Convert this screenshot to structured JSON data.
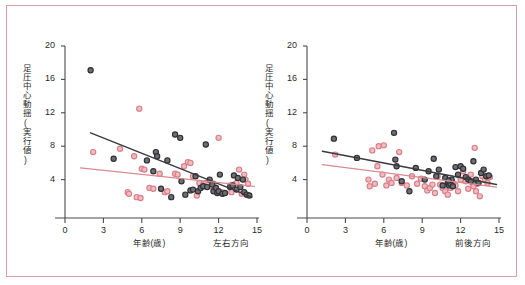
{
  "figure": {
    "frame_color": "#d8a0a6",
    "background": "#ffffff"
  },
  "colors": {
    "series_dark_fill": "#6d6d73",
    "series_dark_stroke": "#2f2f33",
    "series_pink_fill": "#f0bcc0",
    "series_pink_stroke": "#d97f88",
    "fit_dark": "#3b3b3f",
    "fit_pink": "#d98b92",
    "axis": "#4a4a4a"
  },
  "chart_data": [
    {
      "type": "scatter",
      "panel": "left",
      "title": "",
      "xlabel": "年齢(歳)",
      "ylabel": "足圧中心動揺(実行値)",
      "direction_label": "左右方向",
      "xlim": [
        0,
        15
      ],
      "ylim": [
        0,
        20
      ],
      "xticks": [
        0,
        3,
        6,
        9,
        12,
        15
      ],
      "yticks": [
        4,
        8,
        12,
        16,
        20
      ],
      "grid": false,
      "legend": "none",
      "series": [
        {
          "name": "dark",
          "marker": "open-circle-dark",
          "points": [
            [
              2.0,
              17.1
            ],
            [
              3.8,
              6.5
            ],
            [
              6.4,
              6.3
            ],
            [
              6.9,
              5.0
            ],
            [
              7.1,
              7.3
            ],
            [
              7.2,
              6.8
            ],
            [
              7.5,
              2.9
            ],
            [
              8.0,
              6.3
            ],
            [
              8.3,
              1.9
            ],
            [
              8.6,
              9.4
            ],
            [
              9.0,
              9.0
            ],
            [
              9.1,
              3.8
            ],
            [
              9.4,
              2.2
            ],
            [
              9.8,
              2.7
            ],
            [
              10.0,
              2.8
            ],
            [
              10.2,
              4.4
            ],
            [
              10.4,
              2.6
            ],
            [
              10.6,
              3.0
            ],
            [
              10.8,
              3.2
            ],
            [
              11.0,
              8.2
            ],
            [
              11.1,
              3.1
            ],
            [
              11.3,
              4.0
            ],
            [
              11.5,
              3.4
            ],
            [
              11.6,
              2.6
            ],
            [
              11.8,
              3.0
            ],
            [
              11.9,
              2.4
            ],
            [
              12.0,
              2.6
            ],
            [
              12.1,
              4.6
            ],
            [
              12.3,
              2.3
            ],
            [
              12.5,
              2.4
            ],
            [
              12.9,
              3.1
            ],
            [
              13.1,
              3.3
            ],
            [
              13.2,
              4.5
            ],
            [
              13.4,
              2.8
            ],
            [
              13.5,
              4.2
            ],
            [
              13.7,
              3.1
            ],
            [
              13.9,
              4.0
            ],
            [
              14.0,
              2.5
            ],
            [
              14.2,
              2.2
            ],
            [
              14.4,
              2.1
            ]
          ]
        },
        {
          "name": "pink",
          "marker": "open-circle-pink",
          "points": [
            [
              2.2,
              7.3
            ],
            [
              4.3,
              7.7
            ],
            [
              4.9,
              2.5
            ],
            [
              5.0,
              2.3
            ],
            [
              5.4,
              6.8
            ],
            [
              5.6,
              1.9
            ],
            [
              5.8,
              12.5
            ],
            [
              5.9,
              1.8
            ],
            [
              6.0,
              5.3
            ],
            [
              6.2,
              5.2
            ],
            [
              6.6,
              3.0
            ],
            [
              6.9,
              2.9
            ],
            [
              7.4,
              4.7
            ],
            [
              7.8,
              2.5
            ],
            [
              8.0,
              2.6
            ],
            [
              8.6,
              4.7
            ],
            [
              8.8,
              4.6
            ],
            [
              9.3,
              5.6
            ],
            [
              9.6,
              6.1
            ],
            [
              9.8,
              6.0
            ],
            [
              10.0,
              4.4
            ],
            [
              10.3,
              2.1
            ],
            [
              10.5,
              3.6
            ],
            [
              10.8,
              3.4
            ],
            [
              11.0,
              3.6
            ],
            [
              11.2,
              3.4
            ],
            [
              11.4,
              3.2
            ],
            [
              11.6,
              3.5
            ],
            [
              11.8,
              2.6
            ],
            [
              12.0,
              9.0
            ],
            [
              12.2,
              2.5
            ],
            [
              12.4,
              2.4
            ],
            [
              12.9,
              3.3
            ],
            [
              13.0,
              2.5
            ],
            [
              13.2,
              3.4
            ],
            [
              13.4,
              3.6
            ],
            [
              13.6,
              5.2
            ],
            [
              13.8,
              2.3
            ],
            [
              14.0,
              4.6
            ],
            [
              14.1,
              4.0
            ],
            [
              14.3,
              3.5
            ]
          ]
        }
      ],
      "fit_lines": [
        {
          "name": "dark",
          "x0": 2.0,
          "y0": 9.6,
          "x1": 14.6,
          "y1": 1.9,
          "color": "#3b3b3f"
        },
        {
          "name": "pink",
          "x0": 1.2,
          "y0": 5.4,
          "x1": 14.8,
          "y1": 3.2,
          "color": "#d98b92"
        }
      ]
    },
    {
      "type": "scatter",
      "panel": "right",
      "title": "",
      "xlabel": "年齢(歳)",
      "ylabel": "足圧中心動揺(実行値)",
      "direction_label": "前後方向",
      "xlim": [
        0,
        15
      ],
      "ylim": [
        0,
        20
      ],
      "xticks": [
        0,
        3,
        6,
        9,
        12,
        15
      ],
      "yticks": [
        4,
        8,
        12,
        16,
        20
      ],
      "grid": false,
      "legend": "none",
      "series": [
        {
          "name": "dark",
          "marker": "open-circle-dark",
          "points": [
            [
              2.1,
              8.9
            ],
            [
              3.9,
              6.6
            ],
            [
              6.8,
              9.6
            ],
            [
              6.9,
              6.4
            ],
            [
              7.0,
              5.6
            ],
            [
              7.4,
              3.8
            ],
            [
              8.0,
              2.6
            ],
            [
              8.5,
              5.4
            ],
            [
              9.2,
              4.0
            ],
            [
              9.5,
              5.0
            ],
            [
              9.9,
              6.5
            ],
            [
              10.1,
              4.4
            ],
            [
              10.3,
              5.2
            ],
            [
              10.6,
              3.3
            ],
            [
              10.8,
              4.2
            ],
            [
              11.0,
              3.6
            ],
            [
              11.1,
              3.3
            ],
            [
              11.2,
              3.5
            ],
            [
              11.3,
              4.0
            ],
            [
              11.4,
              3.2
            ],
            [
              11.6,
              5.5
            ],
            [
              11.8,
              4.6
            ],
            [
              12.0,
              5.6
            ],
            [
              12.2,
              5.3
            ],
            [
              12.4,
              4.3
            ],
            [
              12.6,
              4.0
            ],
            [
              12.8,
              3.8
            ],
            [
              13.0,
              6.2
            ],
            [
              13.2,
              4.0
            ],
            [
              13.4,
              3.6
            ],
            [
              13.6,
              4.8
            ],
            [
              13.8,
              5.2
            ],
            [
              14.0,
              4.4
            ],
            [
              14.2,
              4.5
            ],
            [
              11.05,
              3.9
            ]
          ]
        },
        {
          "name": "pink",
          "marker": "open-circle-pink",
          "points": [
            [
              2.2,
              7.0
            ],
            [
              4.8,
              4.0
            ],
            [
              4.9,
              3.2
            ],
            [
              5.1,
              7.5
            ],
            [
              5.3,
              3.5
            ],
            [
              5.5,
              5.6
            ],
            [
              5.6,
              8.0
            ],
            [
              5.9,
              4.6
            ],
            [
              6.0,
              8.1
            ],
            [
              6.2,
              3.3
            ],
            [
              6.4,
              4.0
            ],
            [
              6.6,
              3.6
            ],
            [
              7.0,
              4.2
            ],
            [
              7.2,
              7.3
            ],
            [
              7.4,
              3.6
            ],
            [
              7.8,
              3.3
            ],
            [
              8.2,
              4.4
            ],
            [
              8.6,
              3.5
            ],
            [
              8.9,
              4.1
            ],
            [
              9.2,
              3.2
            ],
            [
              9.4,
              2.7
            ],
            [
              9.6,
              3.0
            ],
            [
              9.8,
              3.4
            ],
            [
              10.0,
              2.4
            ],
            [
              10.2,
              4.4
            ],
            [
              10.4,
              3.4
            ],
            [
              10.6,
              3.0
            ],
            [
              10.8,
              2.6
            ],
            [
              11.0,
              2.2
            ],
            [
              11.2,
              3.0
            ],
            [
              11.4,
              3.6
            ],
            [
              11.6,
              3.3
            ],
            [
              11.8,
              2.6
            ],
            [
              12.0,
              4.0
            ],
            [
              12.2,
              5.0
            ],
            [
              12.4,
              3.8
            ],
            [
              12.6,
              2.9
            ],
            [
              12.8,
              4.6
            ],
            [
              13.0,
              3.2
            ],
            [
              13.1,
              7.8
            ],
            [
              13.2,
              2.6
            ],
            [
              13.3,
              3.5
            ],
            [
              13.5,
              2.0
            ],
            [
              13.7,
              4.4
            ],
            [
              13.9,
              4.0
            ],
            [
              14.1,
              3.6
            ],
            [
              14.3,
              4.3
            ]
          ]
        }
      ],
      "fit_lines": [
        {
          "name": "dark",
          "x0": 1.2,
          "y0": 7.4,
          "x1": 14.8,
          "y1": 3.4,
          "color": "#3b3b3f"
        },
        {
          "name": "pink",
          "x0": 1.2,
          "y0": 5.8,
          "x1": 14.8,
          "y1": 3.1,
          "color": "#d98b92"
        }
      ]
    }
  ]
}
